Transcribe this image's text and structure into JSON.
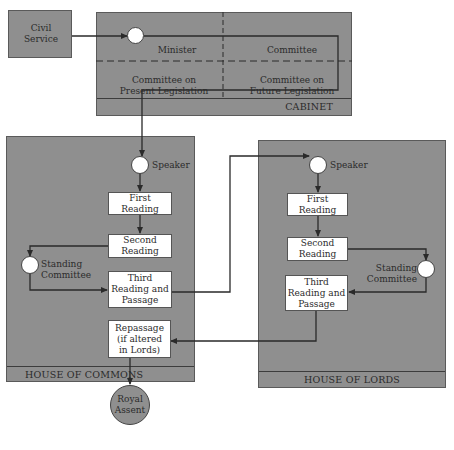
{
  "civil_service": {
    "label": "Civil Service"
  },
  "cabinet": {
    "title": "CABINET",
    "minister": "Minister",
    "committee": "Committee",
    "present_legislation": "Committee on Present Legislation",
    "future_legislation": "Committee on Future Legislation"
  },
  "commons": {
    "title": "HOUSE OF COMMONS",
    "speaker": "Speaker",
    "first_reading": "First Reading",
    "second_reading": "Second Reading",
    "standing_committee": "Standing Committee",
    "third_reading": "Third Reading and Passage",
    "repassage": "Repassage (if altered in Lords)"
  },
  "lords": {
    "title": "HOUSE OF LORDS",
    "speaker": "Speaker",
    "first_reading": "First Reading",
    "second_reading": "Second Reading",
    "standing_committee": "Standing Committee",
    "third_reading": "Third Reading and Passage"
  },
  "royal_assent": {
    "label": "Royal Assent"
  },
  "colors": {
    "panel": "#8f8f8f",
    "box": "#ffffff",
    "line": "#2a2a2a"
  }
}
